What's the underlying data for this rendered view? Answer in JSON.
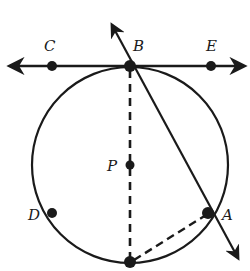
{
  "diagram": {
    "type": "circle-tangent-secant",
    "circle": {
      "center_label": "P",
      "cx": 130,
      "cy": 165,
      "r": 98
    },
    "points": [
      {
        "label": "C",
        "x": 52,
        "y": 66,
        "lx": 44,
        "ly": 50
      },
      {
        "label": "B",
        "x": 130,
        "y": 66,
        "lx": 135,
        "ly": 50
      },
      {
        "label": "E",
        "x": 211,
        "y": 66,
        "lx": 205,
        "ly": 50
      },
      {
        "label": "P",
        "x": 130,
        "y": 165,
        "lx": 109,
        "ly": 170
      },
      {
        "label": "D",
        "x": 52,
        "y": 213,
        "lx": 28,
        "ly": 219
      },
      {
        "label": "A",
        "x": 208,
        "y": 213,
        "lx": 222,
        "ly": 219
      },
      {
        "label": "",
        "x": 130,
        "y": 262
      }
    ],
    "lines": {
      "tangent": {
        "name": "line CE",
        "x1": 6,
        "y1": 66,
        "x2": 248,
        "y2": 66
      },
      "secant": {
        "name": "line BA",
        "x1": 110,
        "y1": 22,
        "x2": 240,
        "y2": 262
      },
      "diameter_dashed": {
        "x1": 130,
        "y1": 66,
        "x2": 130,
        "y2": 262
      },
      "chord_dashed": {
        "x1": 130,
        "y1": 262,
        "x2": 208,
        "y2": 213
      }
    },
    "stroke_color": "#1a1a1a"
  }
}
